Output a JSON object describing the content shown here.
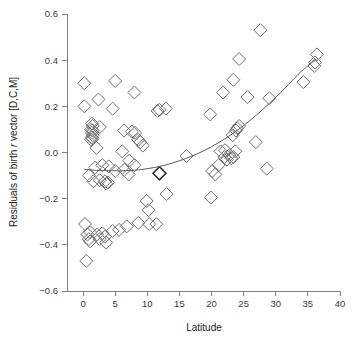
{
  "chart_data": {
    "type": "scatter",
    "title": "",
    "xlabel": "Latitude",
    "ylabel": "Residuals of birth r vector [D,C,M]",
    "ylabel_parts": {
      "lead": "Residuals of birth ",
      "italic": "r",
      "trail": " vector [D,C,M]"
    },
    "xlim": [
      -2.5,
      40
    ],
    "ylim": [
      -0.6,
      0.6
    ],
    "xticks": [
      0,
      5,
      10,
      15,
      20,
      25,
      30,
      35,
      40
    ],
    "xtick_labels": [
      "0",
      "5",
      "10",
      "15",
      "20",
      "25",
      "30",
      "35",
      "40"
    ],
    "yticks": [
      -0.6,
      -0.4,
      -0.2,
      0.0,
      0.2,
      0.4,
      0.6
    ],
    "ytick_labels": [
      "−0.6",
      "−0.4",
      "−0.2",
      "0.0",
      "0.2",
      "0.4",
      "0.6"
    ],
    "grid": false,
    "legend": null,
    "marker": "diamond-open",
    "marker_color": "#6e6e6e",
    "marker_size": 13,
    "axis_color": "#808080",
    "curve_color": "#5a5a5a",
    "points": [
      [
        0.2,
        0.3
      ],
      [
        0.2,
        0.2
      ],
      [
        2.4,
        0.23
      ],
      [
        5.0,
        0.31
      ],
      [
        4.6,
        0.19
      ],
      [
        8.0,
        0.26
      ],
      [
        11.6,
        0.18
      ],
      [
        11.9,
        0.185
      ],
      [
        12.9,
        0.19
      ],
      [
        1.4,
        0.125
      ],
      [
        1.5,
        0.115
      ],
      [
        1.3,
        0.1
      ],
      [
        1.45,
        0.095
      ],
      [
        1.4,
        0.085
      ],
      [
        1.5,
        0.075
      ],
      [
        1.35,
        0.065
      ],
      [
        1.5,
        0.06
      ],
      [
        1.25,
        0.055
      ],
      [
        2.6,
        0.11
      ],
      [
        2.1,
        0.02
      ],
      [
        6.4,
        0.095
      ],
      [
        7.6,
        0.09
      ],
      [
        8.1,
        0.085
      ],
      [
        8.6,
        0.055
      ],
      [
        8.9,
        0.045
      ],
      [
        9.3,
        0.03
      ],
      [
        6.1,
        0.005
      ],
      [
        7.2,
        -0.035
      ],
      [
        8.0,
        -0.055
      ],
      [
        3.0,
        -0.055
      ],
      [
        4.0,
        -0.06
      ],
      [
        1.9,
        -0.065
      ],
      [
        5.0,
        -0.08
      ],
      [
        0.9,
        -0.1
      ],
      [
        1.6,
        -0.125
      ],
      [
        2.6,
        -0.12
      ],
      [
        3.4,
        -0.125
      ],
      [
        3.6,
        -0.135
      ],
      [
        3.9,
        -0.13
      ],
      [
        6.4,
        -0.075
      ],
      [
        7.1,
        -0.095
      ],
      [
        11.9,
        -0.09
      ],
      [
        9.9,
        -0.21
      ],
      [
        13.0,
        -0.18
      ],
      [
        10.2,
        -0.25
      ],
      [
        10.3,
        -0.31
      ],
      [
        11.4,
        -0.31
      ],
      [
        8.6,
        -0.305
      ],
      [
        0.3,
        -0.31
      ],
      [
        1.1,
        -0.345
      ],
      [
        0.7,
        -0.355
      ],
      [
        0.9,
        -0.375
      ],
      [
        1.1,
        -0.385
      ],
      [
        2.2,
        -0.355
      ],
      [
        2.6,
        -0.375
      ],
      [
        3.0,
        -0.35
      ],
      [
        3.4,
        -0.365
      ],
      [
        3.6,
        -0.39
      ],
      [
        4.6,
        -0.34
      ],
      [
        5.6,
        -0.335
      ],
      [
        6.8,
        -0.32
      ],
      [
        0.5,
        -0.47
      ],
      [
        16.1,
        -0.015
      ],
      [
        19.8,
        0.165
      ],
      [
        19.9,
        -0.195
      ],
      [
        20.1,
        -0.08
      ],
      [
        20.6,
        -0.095
      ],
      [
        21.1,
        -0.055
      ],
      [
        21.4,
        0.005
      ],
      [
        22.0,
        -0.02
      ],
      [
        22.1,
        0.01
      ],
      [
        22.4,
        -0.03
      ],
      [
        22.8,
        -0.01
      ],
      [
        23.1,
        -0.025
      ],
      [
        23.4,
        -0.02
      ],
      [
        23.7,
        0.005
      ],
      [
        21.8,
        0.26
      ],
      [
        23.4,
        0.315
      ],
      [
        24.3,
        0.405
      ],
      [
        23.3,
        0.075
      ],
      [
        23.8,
        0.095
      ],
      [
        24.0,
        0.105
      ],
      [
        24.3,
        0.115
      ],
      [
        25.6,
        0.24
      ],
      [
        27.6,
        0.53
      ],
      [
        26.9,
        0.045
      ],
      [
        29.0,
        0.235
      ],
      [
        28.6,
        -0.07
      ],
      [
        34.3,
        0.305
      ],
      [
        36.0,
        0.375
      ],
      [
        36.1,
        0.39
      ],
      [
        36.4,
        0.425
      ]
    ],
    "bold_point": [
      11.9,
      -0.09
    ],
    "fit_curve": {
      "description": "smoothed quadratic trend line",
      "x": [
        0.2,
        2,
        4,
        6,
        8,
        10,
        12,
        14,
        16,
        18,
        20,
        22,
        24,
        26,
        28,
        30,
        32,
        34,
        36.3
      ],
      "y": [
        -0.073,
        -0.077,
        -0.079,
        -0.079,
        -0.077,
        -0.07,
        -0.06,
        -0.045,
        -0.026,
        -0.003,
        0.025,
        0.058,
        0.096,
        0.139,
        0.187,
        0.239,
        0.295,
        0.352,
        0.404
      ]
    }
  }
}
